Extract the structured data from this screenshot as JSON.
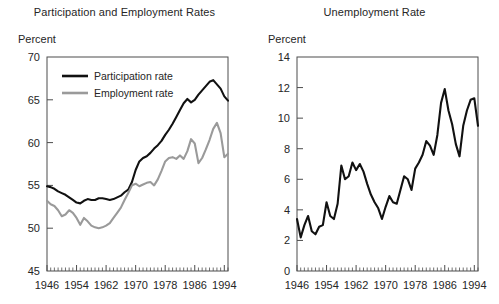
{
  "figure": {
    "panels": [
      "left",
      "right"
    ]
  },
  "left": {
    "title": "Participation and Employment Rates",
    "axis_unit": "Percent",
    "legend": [
      {
        "label": "Participation rate",
        "color": "#111111"
      },
      {
        "label": "Employment rate",
        "color": "#9a9a9a"
      }
    ],
    "ytick_labels": [
      "70",
      "65",
      "60",
      "55",
      "50",
      "45"
    ],
    "xtick_labels": [
      "1946",
      "1954",
      "1962",
      "1970",
      "1978",
      "1986",
      "1994"
    ]
  },
  "right": {
    "title": "Unemployment Rate",
    "axis_unit": "Percent",
    "ytick_labels": [
      "14",
      "12",
      "10",
      "8",
      "6",
      "4",
      "2",
      "0"
    ],
    "xtick_labels": [
      "1946",
      "1954",
      "1962",
      "1970",
      "1978",
      "1986",
      "1994"
    ]
  },
  "chart_data": [
    {
      "type": "line",
      "panel": "left",
      "title": "Participation and Employment Rates",
      "xlabel": "",
      "ylabel": "Percent",
      "xlim": [
        1946,
        1995
      ],
      "ylim": [
        45,
        70
      ],
      "yticks": [
        45,
        50,
        55,
        60,
        65,
        70
      ],
      "xticks": [
        1946,
        1954,
        1962,
        1970,
        1978,
        1986,
        1994
      ],
      "minor_xtick_interval": 1,
      "grid": false,
      "legend_position": "upper-left-inside",
      "x": [
        1946,
        1947,
        1948,
        1949,
        1950,
        1951,
        1952,
        1953,
        1954,
        1955,
        1956,
        1957,
        1958,
        1959,
        1960,
        1961,
        1962,
        1963,
        1964,
        1965,
        1966,
        1967,
        1968,
        1969,
        1970,
        1971,
        1972,
        1973,
        1974,
        1975,
        1976,
        1977,
        1978,
        1979,
        1980,
        1981,
        1982,
        1983,
        1984,
        1985,
        1986,
        1987,
        1988,
        1989,
        1990,
        1991,
        1992,
        1993,
        1994,
        1995
      ],
      "series": [
        {
          "name": "Participation rate",
          "color": "#111111",
          "values": [
            54.9,
            54.8,
            54.6,
            54.3,
            54.1,
            53.9,
            53.6,
            53.3,
            53.0,
            52.9,
            53.2,
            53.4,
            53.3,
            53.3,
            53.5,
            53.5,
            53.4,
            53.3,
            53.4,
            53.6,
            53.8,
            54.2,
            54.5,
            55.4,
            56.8,
            57.8,
            58.2,
            58.4,
            58.8,
            59.3,
            59.7,
            60.2,
            60.9,
            61.5,
            62.2,
            63.0,
            63.8,
            64.6,
            65.1,
            64.7,
            65.0,
            65.6,
            66.1,
            66.6,
            67.1,
            67.3,
            66.8,
            66.3,
            65.4,
            64.9
          ]
        },
        {
          "name": "Employment rate",
          "color": "#9a9a9a",
          "values": [
            53.2,
            52.8,
            52.6,
            52.1,
            51.4,
            51.6,
            52.1,
            51.8,
            51.2,
            50.4,
            51.2,
            50.8,
            50.3,
            50.1,
            50.0,
            50.1,
            50.3,
            50.6,
            51.2,
            51.8,
            52.4,
            53.3,
            54.1,
            55.0,
            55.2,
            54.9,
            55.1,
            55.3,
            55.4,
            55.0,
            55.7,
            56.7,
            57.8,
            58.2,
            58.3,
            58.1,
            58.5,
            58.1,
            59.0,
            60.4,
            59.9,
            57.6,
            58.2,
            59.2,
            60.3,
            61.6,
            62.3,
            61.1,
            58.3,
            58.7
          ]
        }
      ]
    },
    {
      "type": "line",
      "panel": "right",
      "title": "Unemployment Rate",
      "xlabel": "",
      "ylabel": "Percent",
      "xlim": [
        1946,
        1995
      ],
      "ylim": [
        0,
        14
      ],
      "yticks": [
        0,
        2,
        4,
        6,
        8,
        10,
        12,
        14
      ],
      "xticks": [
        1946,
        1954,
        1962,
        1970,
        1978,
        1986,
        1994
      ],
      "minor_xtick_interval": 1,
      "grid": false,
      "legend_position": "none",
      "x": [
        1946,
        1947,
        1948,
        1949,
        1950,
        1951,
        1952,
        1953,
        1954,
        1955,
        1956,
        1957,
        1958,
        1959,
        1960,
        1961,
        1962,
        1963,
        1964,
        1965,
        1966,
        1967,
        1968,
        1969,
        1970,
        1971,
        1972,
        1973,
        1974,
        1975,
        1976,
        1977,
        1978,
        1979,
        1980,
        1981,
        1982,
        1983,
        1984,
        1985,
        1986,
        1987,
        1988,
        1989,
        1990,
        1991,
        1992,
        1993,
        1994,
        1995
      ],
      "series": [
        {
          "name": "Unemployment rate",
          "color": "#111111",
          "values": [
            3.4,
            2.2,
            3.0,
            3.6,
            2.6,
            2.4,
            2.9,
            3.0,
            4.5,
            3.6,
            3.4,
            4.4,
            6.9,
            6.0,
            6.2,
            7.1,
            6.6,
            7.0,
            6.5,
            5.7,
            5.0,
            4.5,
            4.1,
            3.4,
            4.2,
            4.9,
            4.5,
            4.4,
            5.3,
            6.2,
            6.0,
            5.3,
            6.7,
            7.1,
            7.6,
            8.5,
            8.2,
            7.6,
            8.9,
            11.0,
            11.9,
            10.5,
            9.6,
            8.3,
            7.5,
            9.5,
            10.5,
            11.2,
            11.3,
            9.5
          ]
        }
      ]
    }
  ]
}
